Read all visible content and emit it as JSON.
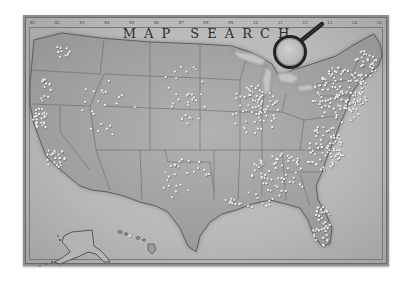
{
  "map": {
    "title": "MAP SEARCH",
    "style": "vintage grayscale parchment",
    "scale_labels": [
      "81",
      "82",
      "83",
      "84",
      "85",
      "86",
      "87",
      "88",
      "89",
      "10",
      "11",
      "12",
      "13",
      "14",
      "15"
    ],
    "colors": {
      "frame": "#8e8e8e",
      "parchment": "#bdbdbd",
      "land": "#a9a9a9",
      "water": "#c6c6c6",
      "borders": "#5e5e5e",
      "pins": "#f2f2f2",
      "magnifier": "#2a2a2a"
    },
    "regions": [
      "Contiguous United States",
      "Alaska",
      "Hawaii"
    ],
    "magnifier_icon": "magnifying-glass-icon",
    "pin_icon": "location-pin-dot"
  },
  "pin_clusters": [
    {
      "name": "west-coast-north",
      "cx": 45,
      "cy": 90,
      "rx": 6,
      "ry": 14,
      "count": 14
    },
    {
      "name": "california-bay",
      "cx": 40,
      "cy": 120,
      "rx": 8,
      "ry": 12,
      "count": 30
    },
    {
      "name": "california-south",
      "cx": 55,
      "cy": 158,
      "rx": 10,
      "ry": 10,
      "count": 22
    },
    {
      "name": "pacific-northwest",
      "cx": 60,
      "cy": 52,
      "rx": 10,
      "ry": 6,
      "count": 10
    },
    {
      "name": "mountain-west",
      "cx": 105,
      "cy": 110,
      "rx": 30,
      "ry": 30,
      "count": 22
    },
    {
      "name": "plains",
      "cx": 185,
      "cy": 95,
      "rx": 25,
      "ry": 30,
      "count": 30
    },
    {
      "name": "texas",
      "cx": 185,
      "cy": 180,
      "rx": 25,
      "ry": 22,
      "count": 26
    },
    {
      "name": "midwest",
      "cx": 255,
      "cy": 110,
      "rx": 25,
      "ry": 25,
      "count": 70
    },
    {
      "name": "southeast",
      "cx": 280,
      "cy": 175,
      "rx": 30,
      "ry": 22,
      "count": 60
    },
    {
      "name": "northeast",
      "cx": 340,
      "cy": 95,
      "rx": 28,
      "ry": 28,
      "count": 130
    },
    {
      "name": "atlantic-coast",
      "cx": 325,
      "cy": 150,
      "rx": 20,
      "ry": 25,
      "count": 70
    },
    {
      "name": "florida",
      "cx": 322,
      "cy": 225,
      "rx": 9,
      "ry": 22,
      "count": 40
    },
    {
      "name": "new-england",
      "cx": 365,
      "cy": 65,
      "rx": 12,
      "ry": 15,
      "count": 35
    },
    {
      "name": "gulf-coast",
      "cx": 250,
      "cy": 200,
      "rx": 28,
      "ry": 8,
      "count": 20
    },
    {
      "name": "hawaii",
      "cx": 130,
      "cy": 236,
      "rx": 2,
      "ry": 2,
      "count": 1
    }
  ]
}
